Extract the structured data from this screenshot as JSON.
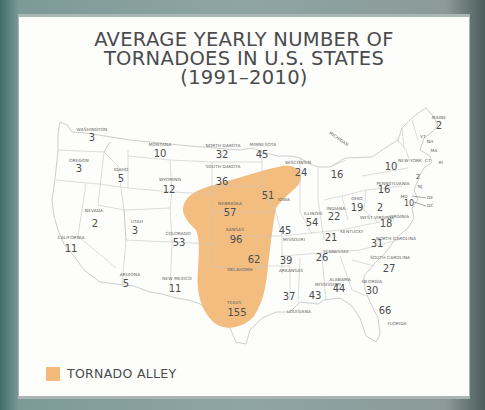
{
  "title": {
    "line1": "AVERAGE YEARLY NUMBER OF",
    "line2": "TORNADOES IN U.S. STATES",
    "line3": "(1991–2010)"
  },
  "legend": {
    "label": "TORNADO ALLEY",
    "color": "#f2b978"
  },
  "colors": {
    "frame": "#a9b6b5",
    "card": "#fdfdfb",
    "text": "#4a4b4d",
    "highlight": "#f2b978",
    "border": "#c4c6c8"
  },
  "states": {
    "washington": {
      "name": "WASHINGTON",
      "value": "3"
    },
    "oregon": {
      "name": "OREGON",
      "value": "3"
    },
    "idaho": {
      "name": "IDAHO",
      "value": "5"
    },
    "montana": {
      "name": "MONTANA",
      "value": "10"
    },
    "wyoming": {
      "name": "WYOMING",
      "value": "12"
    },
    "nevada": {
      "name": "NEVADA",
      "value": "2"
    },
    "california": {
      "name": "CALIFORNIA",
      "value": "11"
    },
    "utah": {
      "name": "UTAH",
      "value": "3"
    },
    "colorado": {
      "name": "COLORADO",
      "value": "53"
    },
    "arizona": {
      "name": "ARIZONA",
      "value": "5"
    },
    "new_mexico": {
      "name": "NEW MEXICO",
      "value": "11"
    },
    "north_dakota": {
      "name": "NORTH DAKOTA",
      "value": "32"
    },
    "south_dakota": {
      "name": "SOUTH DAKOTA",
      "value": "36"
    },
    "nebraska": {
      "name": "NEBRASKA",
      "value": "57"
    },
    "kansas": {
      "name": "KANSAS",
      "value": "96"
    },
    "oklahoma": {
      "name": "OKLAHOMA",
      "value": "62"
    },
    "texas": {
      "name": "TEXAS",
      "value": "155"
    },
    "minnesota": {
      "name": "MINNESOTA",
      "value": "45"
    },
    "iowa": {
      "name": "IOWA",
      "value": "51"
    },
    "missouri": {
      "name": "MISSOURI",
      "value": "45"
    },
    "arkansas": {
      "name": "ARKANSAS",
      "value": "39"
    },
    "louisiana": {
      "name": "LOUISIANA",
      "value": "37"
    },
    "wisconsin": {
      "name": "WISCONSIN",
      "value": "24"
    },
    "illinois": {
      "name": "ILLINOIS",
      "value": "54"
    },
    "mississippi": {
      "name": "MISSISSIPPI",
      "value": "43"
    },
    "michigan": {
      "name": "MICHIGAN",
      "value": "16"
    },
    "indiana": {
      "name": "INDIANA",
      "value": "22"
    },
    "kentucky": {
      "name": "KENTUCKY",
      "value": "21"
    },
    "tennessee": {
      "name": "TENNESSEE",
      "value": "26"
    },
    "alabama": {
      "name": "ALABAMA",
      "value": "44"
    },
    "ohio": {
      "name": "OHIO",
      "value": "19"
    },
    "georgia": {
      "name": "GEORGIA",
      "value": "30"
    },
    "florida": {
      "name": "FLORIDA",
      "value": "66"
    },
    "south_carolina": {
      "name": "SOUTH CAROLINA",
      "value": "27"
    },
    "north_carolina": {
      "name": "NORTH CAROLINA",
      "value": "31"
    },
    "virginia": {
      "name": "VIRGINIA",
      "value": "18"
    },
    "west_virginia": {
      "name": "WEST VIRGINIA",
      "value": "2"
    },
    "pennsylvania": {
      "name": "PENNSYLVANIA",
      "value": "16"
    },
    "new_york": {
      "name": "NEW YORK",
      "value": "10"
    },
    "maine": {
      "name": "MAINE",
      "value": "2"
    },
    "vermont": {
      "name": "VT",
      "value": "1"
    },
    "new_hampshire": {
      "name": "NH",
      "value": "1"
    },
    "massachusetts": {
      "name": "MA",
      "value": "1"
    },
    "connecticut": {
      "name": "CT",
      "value": "2"
    },
    "rhode_island": {
      "name": "RI",
      "value": "0"
    },
    "new_jersey": {
      "name": "NJ",
      "value": "2"
    },
    "maryland": {
      "name": "MD",
      "value": "10"
    },
    "delaware": {
      "name": "DE",
      "value": "1"
    },
    "dc": {
      "name": "DC",
      "value": "0"
    }
  }
}
